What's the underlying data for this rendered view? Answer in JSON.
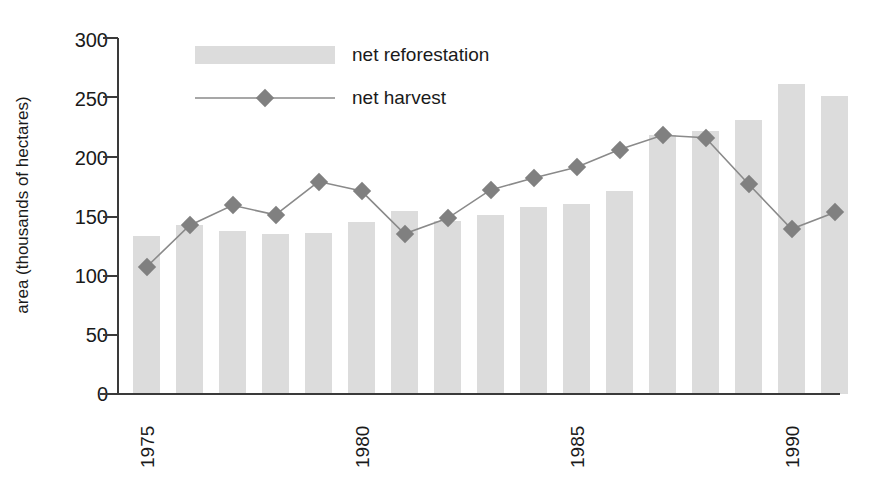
{
  "chart_data": {
    "type": "bar",
    "title": "",
    "xlabel": "",
    "ylabel": "area (thousands of hectares)",
    "ylim": [
      0,
      300
    ],
    "yticks": [
      0,
      50,
      100,
      150,
      200,
      250,
      300
    ],
    "ytick_labels": [
      "0",
      "50",
      "100",
      "150",
      "200",
      "250",
      "300"
    ],
    "grid": false,
    "legend_position": "top-center",
    "categories": [
      1975,
      1976,
      1977,
      1978,
      1979,
      1980,
      1981,
      1982,
      1983,
      1984,
      1985,
      1986,
      1987,
      1988,
      1989,
      1990,
      1991
    ],
    "xtick_labels": [
      "1975",
      "1980",
      "1985",
      "1990"
    ],
    "xtick_values": [
      1975,
      1980,
      1985,
      1990
    ],
    "series": [
      {
        "name": "net reforestation",
        "type": "bar",
        "color": "#dcdcdc",
        "values": [
          133,
          142,
          137,
          135,
          136,
          145,
          154,
          146,
          151,
          158,
          160,
          171,
          218,
          222,
          231,
          261,
          251
        ]
      },
      {
        "name": "net harvest",
        "type": "line",
        "color": "#808080",
        "marker": "diamond",
        "values": [
          107,
          142,
          159,
          151,
          179,
          171,
          135,
          148,
          172,
          182,
          191,
          206,
          218,
          216,
          177,
          139,
          153
        ]
      }
    ]
  },
  "legend": {
    "items": [
      {
        "label": "net reforestation",
        "kind": "bar-swatch"
      },
      {
        "label": "net harvest",
        "kind": "line-marker"
      }
    ]
  },
  "axes": {
    "y_axis_title": "area (thousands of hectares)"
  }
}
